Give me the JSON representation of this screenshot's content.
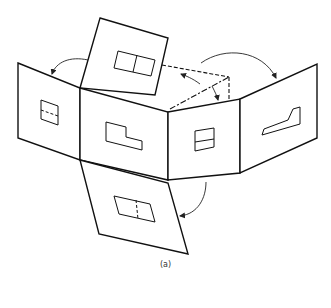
{
  "figure": {
    "caption": "(a)",
    "colors": {
      "line": "#111111",
      "background": "#ffffff"
    }
  },
  "panels": [
    {
      "id": "left-side-view",
      "feature": "square with hidden center line"
    },
    {
      "id": "top-view",
      "feature": "rectangle divided vertically"
    },
    {
      "id": "front-view",
      "feature": "L-shaped step profile"
    },
    {
      "id": "right-side-view",
      "feature": "square with horizontal line"
    },
    {
      "id": "rear-view",
      "feature": "mirrored L-shaped step profile"
    },
    {
      "id": "bottom-view",
      "feature": "rectangle with hidden dividing line"
    }
  ],
  "arrows": [
    {
      "id": "arrow-top-to-left"
    },
    {
      "id": "arrow-top-to-right-dashed"
    },
    {
      "id": "arrow-to-rear"
    },
    {
      "id": "arrow-bottom-rotation"
    }
  ]
}
